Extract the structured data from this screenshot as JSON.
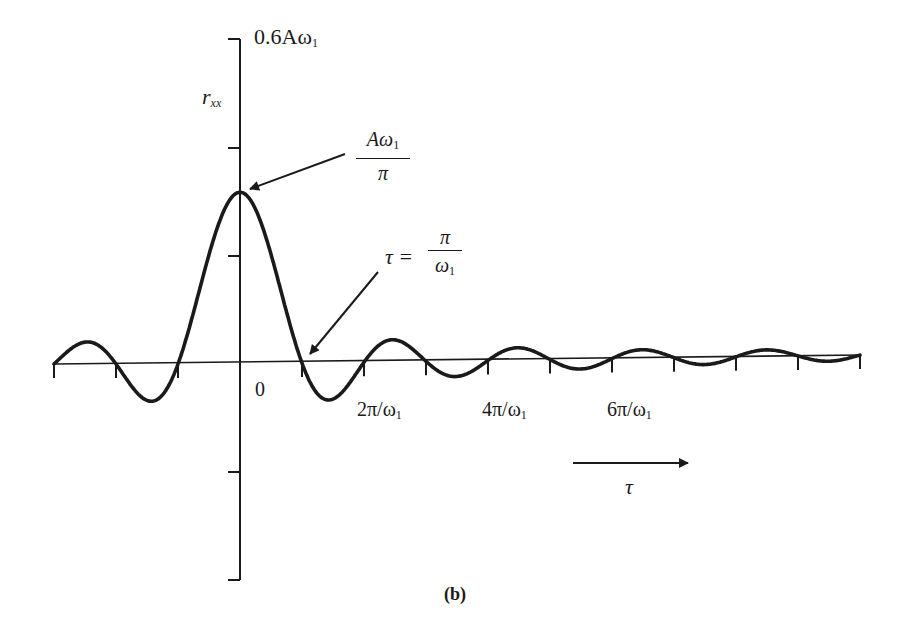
{
  "figure": {
    "caption": "(b)",
    "y_axis_label": "r",
    "y_axis_label_sub": "xx",
    "y_top_label": "0.6Aω",
    "y_top_label_sub": "1",
    "origin_label": "0",
    "peak_annotation": {
      "numerator": "Aω",
      "numerator_sub": "1",
      "denominator": "π"
    },
    "zero_annotation": {
      "lhs": "τ =",
      "numerator": "π",
      "denominator": "ω",
      "denominator_sub": "1"
    },
    "x_tick_labels": [
      {
        "text": "2π/ω",
        "sub": "1"
      },
      {
        "text": "4π/ω",
        "sub": "1"
      },
      {
        "text": "6π/ω",
        "sub": "1"
      }
    ],
    "direction_arrow_label": "τ"
  },
  "chart_data": {
    "type": "line",
    "title": "",
    "caption": "(b)",
    "function": "r_xx(τ) = (Aω1/π)·sin(ω1·τ)/(ω1·τ)",
    "xlabel": "τ",
    "ylabel": "r_xx",
    "x_unit": "π/ω1",
    "y_unit": "Aω1",
    "xlim": [
      -3,
      10
    ],
    "ylim": [
      -0.4,
      0.6
    ],
    "y_ticks": [
      -0.4,
      -0.2,
      0,
      0.2,
      0.4,
      0.6
    ],
    "y_tick_labels_shown": {
      "0.6": "0.6Aω1"
    },
    "x_ticks": [
      -3,
      -2,
      -1,
      1,
      2,
      3,
      4,
      5,
      6,
      7,
      8,
      9,
      10
    ],
    "x_tick_labels_shown": {
      "0": "0",
      "2": "2π/ω1",
      "4": "4π/ω1",
      "6": "6π/ω1"
    },
    "peak": {
      "x": 0,
      "y": 0.318,
      "label": "Aω1/π"
    },
    "first_zero": {
      "x": 1,
      "label": "τ = π/ω1"
    },
    "series": [
      {
        "name": "r_xx",
        "x": [
          -3,
          -2.5,
          -2,
          -1.5,
          -1,
          -0.5,
          0,
          0.5,
          1,
          1.5,
          2,
          2.5,
          3,
          3.5,
          4,
          4.5,
          5,
          5.5,
          6,
          6.5,
          7,
          7.5,
          8,
          8.5,
          9,
          9.5,
          10
        ],
        "values": [
          0,
          0.041,
          0,
          -0.068,
          0,
          0.203,
          0.318,
          0.203,
          0,
          -0.068,
          0,
          0.041,
          0,
          -0.029,
          0,
          0.023,
          0,
          -0.018,
          0,
          0.016,
          0,
          -0.014,
          0,
          0.012,
          0,
          -0.011,
          0
        ]
      }
    ],
    "grid": false,
    "legend": null
  },
  "layout": {
    "origin_x": 240,
    "origin_y": 364,
    "right_y": 355,
    "px_per_x_unit": 62,
    "px_per_y_unit": 540,
    "ink": "#1a1a1a"
  }
}
